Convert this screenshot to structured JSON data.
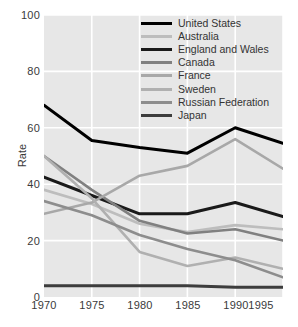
{
  "chart_data": {
    "type": "line",
    "title": "",
    "xlabel": "",
    "ylabel": "Rate",
    "x": [
      1970,
      1975,
      1980,
      1985,
      1990,
      1995
    ],
    "xtick_labels": [
      "1970",
      "1975",
      "1980",
      "1985",
      "1990",
      "1995"
    ],
    "ytick_labels": [
      "0",
      "20",
      "40",
      "60",
      "80",
      "100"
    ],
    "yticks": [
      0,
      20,
      40,
      60,
      80,
      100
    ],
    "xlim": [
      1970,
      1995
    ],
    "ylim": [
      0,
      100
    ],
    "grid": true,
    "grid_color": "#ffffff",
    "plot_background": "#e7e7e7",
    "legend_position": "upper right",
    "series": [
      {
        "name": "United States",
        "color": "#000000",
        "width": 3.0,
        "values": [
          68,
          55.5,
          53,
          51,
          60,
          54.5
        ]
      },
      {
        "name": "Australia",
        "color": "#bdbdbd",
        "width": 2.6,
        "values": [
          38,
          33,
          26,
          23,
          25.5,
          24
        ]
      },
      {
        "name": "England and Wales",
        "color": "#1a1a1a",
        "width": 3.0,
        "values": [
          42.5,
          36,
          29.5,
          29.5,
          33.5,
          28.5
        ]
      },
      {
        "name": "Canada",
        "color": "#808080",
        "width": 2.6,
        "values": [
          50,
          38,
          27,
          22.5,
          24,
          20
        ]
      },
      {
        "name": "France",
        "color": "#a8a8a8",
        "width": 2.6,
        "values": [
          29.5,
          33.5,
          43,
          46.5,
          56,
          45.5
        ]
      },
      {
        "name": "Sweden",
        "color": "#b0b0b0",
        "width": 2.6,
        "values": [
          50,
          35,
          16,
          11,
          14,
          10
        ]
      },
      {
        "name": "Russian Federation",
        "color": "#8d8d8d",
        "width": 2.6,
        "values": [
          34,
          29,
          22,
          17,
          13,
          7
        ]
      },
      {
        "name": "Japan",
        "color": "#3d3d3d",
        "width": 3.0,
        "values": [
          4,
          4,
          4,
          4,
          3.5,
          3.5
        ]
      }
    ]
  }
}
